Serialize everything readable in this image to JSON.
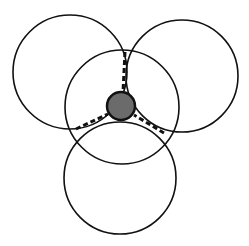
{
  "diagram": {
    "colors": {
      "background": "#ffffff",
      "stroke": "#111111",
      "node_fill": "#6b6b6b",
      "node_stroke": "#111111"
    },
    "circles": [
      {
        "id": "top-left-circle",
        "cx": 70,
        "cy": 72,
        "r": 57
      },
      {
        "id": "top-right-circle",
        "cx": 182,
        "cy": 76,
        "r": 56
      },
      {
        "id": "center-circle",
        "cx": 122,
        "cy": 107,
        "r": 57
      },
      {
        "id": "bottom-circle",
        "cx": 120,
        "cy": 178,
        "r": 56
      }
    ],
    "central_node": {
      "cx": 121,
      "cy": 106,
      "r": 14
    },
    "dashed_connectors": [
      {
        "id": "connector-top",
        "x1": 125,
        "y1": 52,
        "x2": 123,
        "y2": 92
      },
      {
        "id": "connector-left",
        "x1": 76,
        "y1": 129,
        "x2": 108,
        "y2": 114
      },
      {
        "id": "connector-right",
        "x1": 164,
        "y1": 133,
        "x2": 134,
        "y2": 115
      }
    ]
  }
}
